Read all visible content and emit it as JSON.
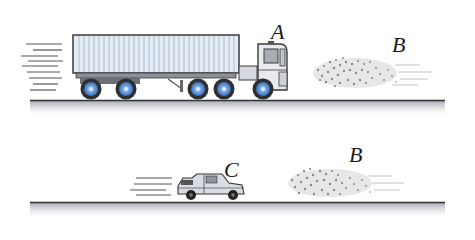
{
  "figure": {
    "top_scene": {
      "vehicle_label": "A",
      "cloud_label": "B"
    },
    "bottom_scene": {
      "vehicle_label": "C",
      "cloud_label": "B"
    },
    "colors": {
      "trailer_fill": "#e4ecf6",
      "trailer_ribs": "#a9b8cc",
      "outline": "#3a3a3a",
      "wheel_hub": "#6f9fe0",
      "road_shadow": "#c4c6cc",
      "particles": "#8a8a8a"
    }
  }
}
